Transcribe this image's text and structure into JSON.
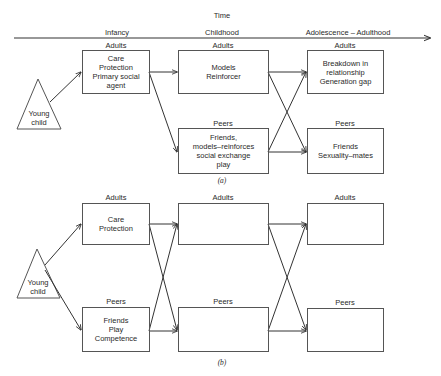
{
  "time_axis": {
    "title": "Time",
    "stages": [
      "Infancy",
      "Childhood",
      "Adolescence – Adulthood"
    ]
  },
  "diagram_a": {
    "caption": "(a)",
    "origin": "Young\nchild",
    "adults": [
      {
        "header": "Adults",
        "text": "Care\nProtection\nPrimary social\nagent"
      },
      {
        "header": "Adults",
        "text": "Models\nReinforcer"
      },
      {
        "header": "Adults",
        "text": "Breakdown in\nrelationship\nGeneration gap"
      }
    ],
    "peers": [
      {
        "header": "Peers",
        "text": "Friends,\nmodels–reinforces\nsocial exchange\nplay"
      },
      {
        "header": "Peers",
        "text": "Friends\nSexuality–mates"
      }
    ]
  },
  "diagram_b": {
    "caption": "(b)",
    "origin": "Young\nchild",
    "adults": [
      {
        "header": "Adults",
        "text": "Care\nProtection"
      },
      {
        "header": "Adults",
        "text": ""
      },
      {
        "header": "Adults",
        "text": ""
      }
    ],
    "peers": [
      {
        "header": "Peers",
        "text": "Friends\nPlay\nCompetence"
      },
      {
        "header": "Peers",
        "text": ""
      },
      {
        "header": "Peers",
        "text": ""
      }
    ]
  },
  "colors": {
    "line": "#333333",
    "background": "#ffffff"
  }
}
